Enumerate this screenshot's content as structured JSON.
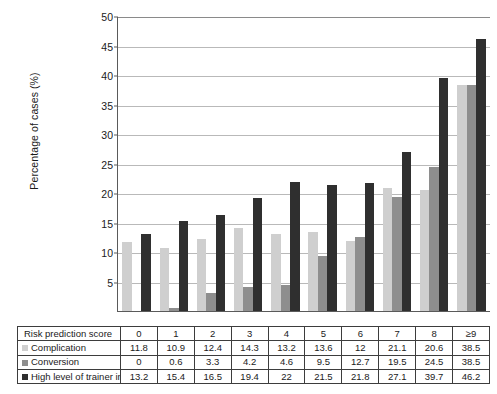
{
  "chart_data": {
    "type": "bar",
    "title": "",
    "xlabel": "Risk prediction score",
    "ylabel": "Percentage of cases (%)",
    "ylim": [
      0,
      50
    ],
    "yticks": [
      5,
      10,
      15,
      20,
      25,
      30,
      35,
      40,
      45,
      50
    ],
    "grid": true,
    "legend_position": "table-row-labels",
    "categories": [
      "0",
      "1",
      "2",
      "3",
      "4",
      "5",
      "6",
      "7",
      "8",
      "≥9"
    ],
    "series": [
      {
        "name": "Complication",
        "color": "#cfcfcf",
        "values": [
          11.8,
          10.9,
          12.4,
          14.3,
          13.2,
          13.6,
          12,
          21.1,
          20.6,
          38.5
        ]
      },
      {
        "name": "Conversion",
        "color": "#8e8e8e",
        "values": [
          0,
          0.6,
          3.3,
          4.2,
          4.6,
          9.5,
          12.7,
          19.5,
          24.5,
          38.5
        ]
      },
      {
        "name": "High level of trainer input",
        "color": "#2f2f2f",
        "values": [
          13.2,
          15.4,
          16.5,
          19.4,
          22,
          21.5,
          21.8,
          27.1,
          39.7,
          46.2
        ]
      }
    ]
  },
  "table": {
    "header_label": "Risk prediction score",
    "columns": [
      "0",
      "1",
      "2",
      "3",
      "4",
      "5",
      "6",
      "7",
      "8",
      "≥9"
    ],
    "rows": [
      {
        "label": "Complication",
        "swatch": "#cfcfcf",
        "values": [
          "11.8",
          "10.9",
          "12.4",
          "14.3",
          "13.2",
          "13.6",
          "12",
          "21.1",
          "20.6",
          "38.5"
        ]
      },
      {
        "label": "Conversion",
        "swatch": "#8e8e8e",
        "values": [
          "0",
          "0.6",
          "3.3",
          "4.2",
          "4.6",
          "9.5",
          "12.7",
          "19.5",
          "24.5",
          "38.5"
        ]
      },
      {
        "label": "High level of trainer input",
        "swatch": "#2f2f2f",
        "values": [
          "13.2",
          "15.4",
          "16.5",
          "19.4",
          "22",
          "21.5",
          "21.8",
          "27.1",
          "39.7",
          "46.2"
        ]
      }
    ]
  }
}
